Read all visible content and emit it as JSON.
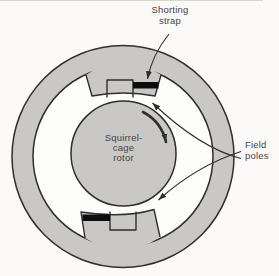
{
  "figure": {
    "labels": {
      "shorting_strap": {
        "line1": "Shorting",
        "line2": "strap"
      },
      "field_poles": {
        "line1": "Field",
        "line2": "poles"
      },
      "rotor": {
        "line1": "Squirrel-",
        "line2": "cage",
        "line3": "rotor"
      }
    },
    "icons": {
      "rotation_arrow": "clockwise-rotation-arrow",
      "leader_shorting": "arrow-to-shorting-strap",
      "leader_field_top": "arrow-to-top-field-pole",
      "leader_field_bottom": "arrow-to-bottom-field-pole"
    },
    "colors": {
      "background": "#fbfaf8",
      "stator_fill": "#c9c8c6",
      "cavity_fill": "#fdfdfc",
      "rotor_fill": "#c9c8c6",
      "strap_fill": "#0d0d0d",
      "outline": "#2f2f2f",
      "text": "#454545"
    }
  }
}
